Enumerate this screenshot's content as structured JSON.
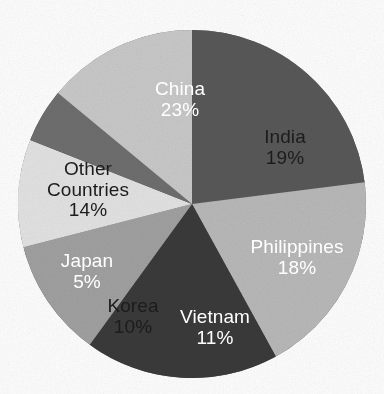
{
  "chart_data": {
    "type": "pie",
    "title": "",
    "subtitle": "",
    "xlabel": "",
    "ylabel": "",
    "legend_position": "none",
    "grid": false,
    "units": "percent",
    "start_angle_deg": 0,
    "direction": "clockwise",
    "categories": [
      "China",
      "India",
      "Philippines",
      "Vietnam",
      "Korea",
      "Japan",
      "Other Countries"
    ],
    "values": [
      23,
      19,
      18,
      11,
      10,
      5,
      14
    ],
    "labels": [
      "23%",
      "19%",
      "18%",
      "11%",
      "10%",
      "5%",
      "14%"
    ],
    "colors": [
      "#585858",
      "#b8b8b8",
      "#3a3a3a",
      "#a0a0a0",
      "#e2e2e2",
      "#6e6e6e",
      "#c8c8c8"
    ],
    "slices": [
      {
        "name": "China",
        "name_line1": "China",
        "name_line2": "",
        "value": 23,
        "percent_label": "23%",
        "color": "#585858",
        "text_color": "#ffffff",
        "text_style": "light",
        "label_x": 180,
        "label_y": 100
      },
      {
        "name": "India",
        "name_line1": "India",
        "name_line2": "",
        "value": 19,
        "percent_label": "19%",
        "color": "#b8b8b8",
        "text_color": "#1c1c1c",
        "text_style": "dark",
        "label_x": 285,
        "label_y": 148
      },
      {
        "name": "Philippines",
        "name_line1": "Philippines",
        "name_line2": "",
        "value": 18,
        "percent_label": "18%",
        "color": "#3a3a3a",
        "text_color": "#ffffff",
        "text_style": "light",
        "label_x": 297,
        "label_y": 258
      },
      {
        "name": "Vietnam",
        "name_line1": "Vietnam",
        "name_line2": "",
        "value": 11,
        "percent_label": "11%",
        "color": "#a0a0a0",
        "text_color": "#ffffff",
        "text_style": "light",
        "label_x": 215,
        "label_y": 328
      },
      {
        "name": "Korea",
        "name_line1": "Korea",
        "name_line2": "",
        "value": 10,
        "percent_label": "10%",
        "color": "#e2e2e2",
        "text_color": "#1c1c1c",
        "text_style": "dark",
        "label_x": 133,
        "label_y": 317
      },
      {
        "name": "Japan",
        "name_line1": "Japan",
        "name_line2": "",
        "value": 5,
        "percent_label": "5%",
        "color": "#6e6e6e",
        "text_color": "#ffffff",
        "text_style": "light",
        "label_x": 87,
        "label_y": 272
      },
      {
        "name": "Other Countries",
        "name_line1": "Other",
        "name_line2": "Countries",
        "value": 14,
        "percent_label": "14%",
        "color": "#c8c8c8",
        "text_color": "#1c1c1c",
        "text_style": "dark",
        "label_x": 88,
        "label_y": 190
      }
    ],
    "geometry": {
      "center_x": 192,
      "center_y": 204,
      "radius": 174
    },
    "background_color": "#fdfdfd"
  }
}
